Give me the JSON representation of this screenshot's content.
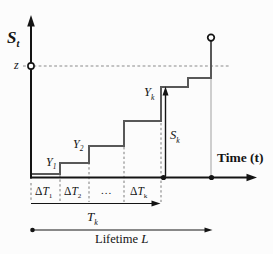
{
  "figure": {
    "labels": {
      "y_axis": {
        "base": "S",
        "sub": "t"
      },
      "threshold": "z",
      "x_axis": "Time (t)",
      "y1": {
        "base": "Y",
        "sub": "1"
      },
      "y2": {
        "base": "Y",
        "sub": "2"
      },
      "yk": {
        "base": "Y",
        "sub": "k"
      },
      "sk": {
        "base": "S",
        "sub": "k"
      },
      "dt1": {
        "prefix": "Δ",
        "base": "T",
        "sub": "1"
      },
      "dt2": {
        "prefix": "Δ",
        "base": "T",
        "sub": "2"
      },
      "ellipsis": "...",
      "dtk": {
        "prefix": "Δ",
        "base": "T",
        "sub": "k"
      },
      "tk": {
        "base": "T",
        "sub": "k"
      },
      "lifetime": {
        "text": "Lifetime",
        "var": "L"
      }
    },
    "colors": {
      "axis": "#141414",
      "staircase": "#585858",
      "threshold_dash": "#8a8a8a",
      "interval_dash": "#7d7d7d",
      "guide": "#a0a0a0",
      "background": "#fcfcfc"
    }
  }
}
